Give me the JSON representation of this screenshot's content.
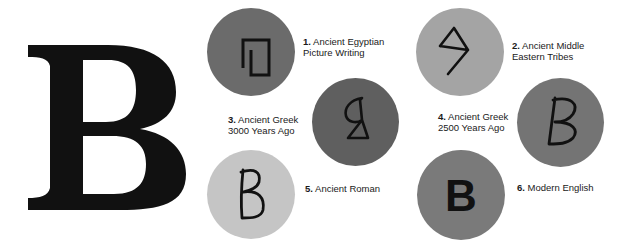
{
  "title_letter": "B",
  "colors": {
    "background": "#ffffff",
    "ink": "#111111"
  },
  "stages": [
    {
      "number": "1.",
      "line1": "Ancient Egyptian",
      "line2": "Picture Writing",
      "glyph": "egyptian-house-glyph",
      "disc_color": "#6b6b6b"
    },
    {
      "number": "2.",
      "line1": "Ancient Middle",
      "line2": "Eastern Tribes",
      "glyph": "middle-eastern-glyph",
      "disc_color": "#a4a4a4"
    },
    {
      "number": "3.",
      "line1": "Ancient Greek",
      "line2": "3000 Years Ago",
      "glyph": "greek-3000-glyph",
      "disc_color": "#5f5f5f"
    },
    {
      "number": "4.",
      "line1": "Ancient Greek",
      "line2": "2500 Years Ago",
      "glyph": "greek-2500-glyph",
      "disc_color": "#747474"
    },
    {
      "number": "5.",
      "line1": "Ancient Roman",
      "line2": "",
      "glyph": "roman-b-glyph",
      "disc_color": "#c5c5c5"
    },
    {
      "number": "6.",
      "line1": "Modern English",
      "line2": "",
      "glyph": "modern-b-glyph",
      "disc_color": "#7a7a7a"
    }
  ]
}
